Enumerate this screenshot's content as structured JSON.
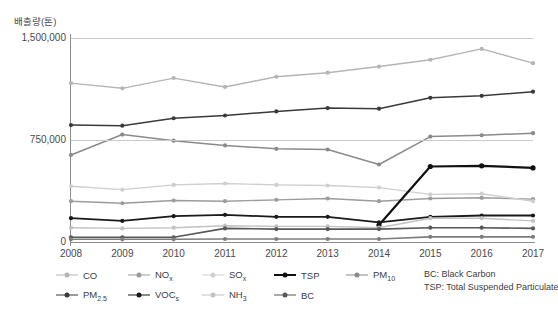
{
  "chart_data": {
    "type": "line",
    "title": "",
    "xlabel": "",
    "ylabel": "배출량(톤)",
    "x": [
      2008,
      2009,
      2010,
      2011,
      2012,
      2013,
      2014,
      2015,
      2016,
      2017
    ],
    "xtick_labels": [
      "2008",
      "2009",
      "2010",
      "2011",
      "2012",
      "2013",
      "2014",
      "2015",
      "2016",
      "2017"
    ],
    "ytick_labels": [
      "0",
      "750,000",
      "1,500,000"
    ],
    "ytick_values": [
      0,
      750000,
      1500000
    ],
    "ylim": [
      0,
      1500000
    ],
    "grid": true,
    "legend_position": "bottom",
    "series": [
      {
        "name": "CO",
        "label": "CO",
        "color": "#b5b5b5",
        "width": 1.4,
        "marker": "circle",
        "values": [
          1168000,
          1130000,
          1205000,
          1140000,
          1215000,
          1245000,
          1290000,
          1340000,
          1420000,
          1315000
        ]
      },
      {
        "name": "NOx",
        "label": "NO",
        "sub": "x",
        "color": "#9c9c9c",
        "width": 1.4,
        "marker": "circle",
        "values": [
          300000,
          285000,
          305000,
          300000,
          310000,
          320000,
          300000,
          320000,
          325000,
          315000
        ]
      },
      {
        "name": "SOx",
        "label": "SO",
        "sub": "x",
        "color": "#cfcfcf",
        "width": 1.4,
        "marker": "circle",
        "values": [
          410000,
          385000,
          420000,
          430000,
          420000,
          415000,
          400000,
          350000,
          355000,
          300000
        ]
      },
      {
        "name": "TSP",
        "label": "TSP",
        "color": "#101010",
        "width": 2.2,
        "marker": "circle",
        "values": [
          null,
          null,
          null,
          null,
          null,
          null,
          125000,
          555000,
          560000,
          545000
        ]
      },
      {
        "name": "PM10",
        "label": "PM",
        "sub": "10",
        "color": "#8a8a8a",
        "width": 1.5,
        "marker": "circle",
        "values": [
          640000,
          790000,
          745000,
          710000,
          685000,
          680000,
          570000,
          775000,
          785000,
          800000
        ]
      },
      {
        "name": "PM2.5",
        "label": "PM",
        "sub": "2.5",
        "color": "#3a3a3a",
        "width": 1.5,
        "marker": "circle",
        "values": [
          860000,
          855000,
          910000,
          930000,
          960000,
          985000,
          980000,
          1060000,
          1075000,
          1105000
        ]
      },
      {
        "name": "VOCs",
        "label": "VOC",
        "sub": "s",
        "color": "#1a1a1a",
        "width": 1.8,
        "marker": "circle",
        "values": [
          175000,
          155000,
          190000,
          200000,
          185000,
          185000,
          145000,
          185000,
          195000,
          195000
        ]
      },
      {
        "name": "NH3",
        "label": "NH",
        "sub": "3",
        "color": "#c2c2c2",
        "width": 1.4,
        "marker": "circle",
        "values": [
          105000,
          100000,
          105000,
          120000,
          115000,
          115000,
          105000,
          175000,
          175000,
          155000
        ]
      },
      {
        "name": "BC",
        "label": "BC",
        "color": "#585858",
        "width": 1.6,
        "marker": "circle",
        "values": [
          35000,
          35000,
          35000,
          100000,
          95000,
          95000,
          95000,
          105000,
          105000,
          100000
        ]
      },
      {
        "name": "BC-low",
        "label": "",
        "color": "#7e7e7e",
        "width": 1.6,
        "marker": "circle",
        "hide_legend": true,
        "values": [
          20000,
          20000,
          20000,
          22000,
          22000,
          22000,
          22000,
          38000,
          38000,
          38000
        ]
      }
    ],
    "footnotes": [
      "BC: Black Carbon",
      "TSP: Total Suspended Particulate"
    ]
  }
}
